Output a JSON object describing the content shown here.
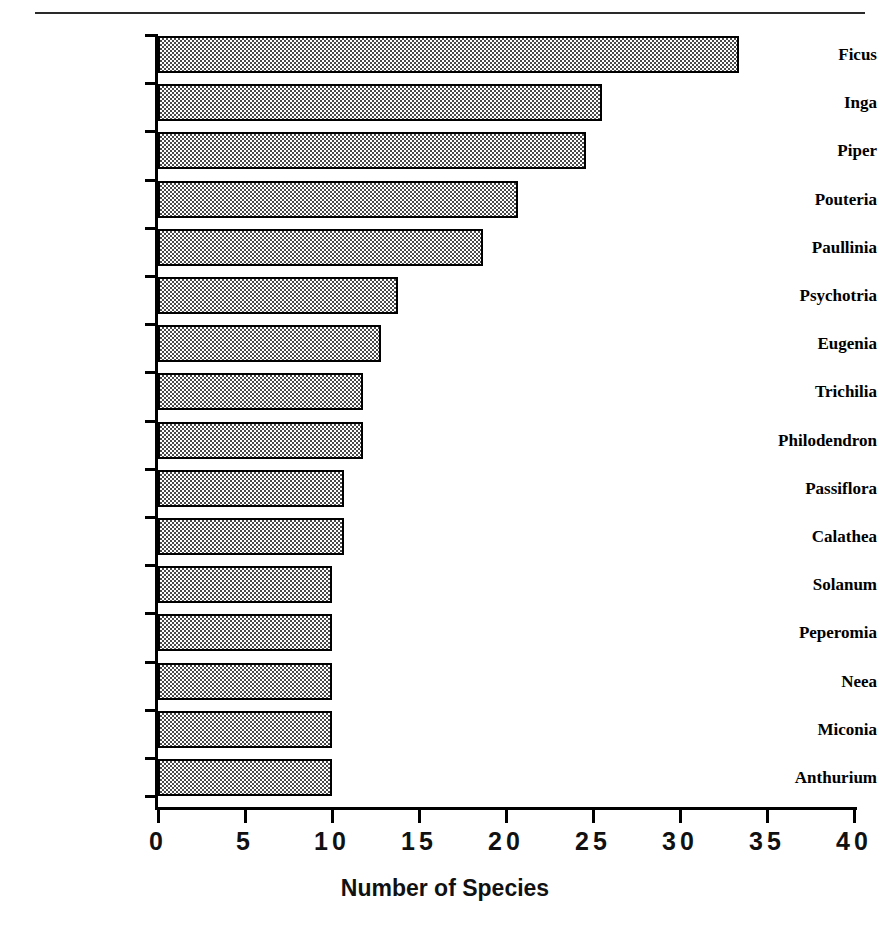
{
  "figure": {
    "top_rule": "horizontal-rule",
    "clipped_header_text": "",
    "clipped_caption_text": ""
  },
  "chart_data": {
    "type": "bar",
    "orientation": "horizontal",
    "title": "",
    "xlabel": "Number of Species",
    "ylabel": "",
    "xlim": [
      0,
      40
    ],
    "xticks": [
      0,
      5,
      10,
      15,
      20,
      25,
      30,
      35,
      40
    ],
    "xtick_labels": [
      "0",
      "5",
      "10",
      "15",
      "20",
      "25",
      "30",
      "35",
      "40"
    ],
    "grid": false,
    "legend": null,
    "categories": [
      "Ficus",
      "Inga",
      "Piper",
      "Pouteria",
      "Paullinia",
      "Psychotria",
      "Eugenia",
      "Trichilia",
      "Philodendron",
      "Passiflora",
      "Calathea",
      "Solanum",
      "Peperomia",
      "Neea",
      "Miconia",
      "Anthurium"
    ],
    "values": [
      33.4,
      25.5,
      24.6,
      20.7,
      18.7,
      13.8,
      12.8,
      11.8,
      11.8,
      10.7,
      10.7,
      10,
      10,
      10,
      10,
      10
    ],
    "bar_fill": "#4a4a4a",
    "bar_edge": "#000000",
    "axis_color": "#000000"
  }
}
